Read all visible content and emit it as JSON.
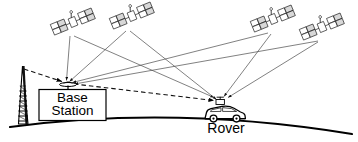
{
  "diagram": {
    "title_visible": false,
    "type": "gnss-differential-positioning-schematic",
    "background_color": "#ffffff",
    "ink_color": "#000000",
    "signal_line_color": "#4a4a4a",
    "ground": {
      "name": "earth-surface-curve",
      "description": "curved horizon arc"
    },
    "labels": {
      "base_station_line1": "Base",
      "base_station_line2": "Station",
      "rover": "Rover"
    },
    "satellites": [
      {
        "id": "sat-1",
        "x": 73,
        "y": 22
      },
      {
        "id": "sat-2",
        "x": 132,
        "y": 16
      },
      {
        "id": "sat-3",
        "x": 273,
        "y": 19
      },
      {
        "id": "sat-4",
        "x": 322,
        "y": 27
      }
    ],
    "base_station": {
      "name": "base-station",
      "antenna_x": 66,
      "antenna_y": 83,
      "tower_label": "lattice-tower"
    },
    "rover": {
      "name": "rover",
      "antenna_x": 222,
      "antenna_y": 99,
      "vehicle_label": "car-with-roof-antenna"
    },
    "links": {
      "satellite_to_base": "solid thin ray",
      "satellite_to_rover": "solid thin ray",
      "base_to_rover": "dashed correction link"
    }
  }
}
